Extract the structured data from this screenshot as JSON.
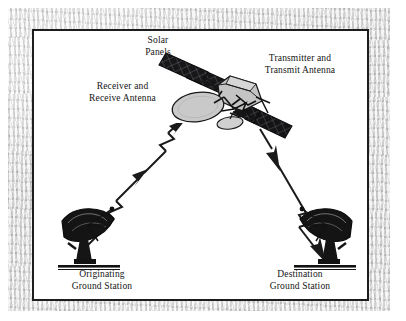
{
  "figure": {
    "type": "satellite-communication-link-diagram",
    "background_color": "#ffffff",
    "frame_color": "#1d1d1d",
    "margin_color": "#d9d9d9",
    "labels": {
      "solar_panels_line1": "Solar",
      "solar_panels_line2": "Panels",
      "transmitter_line1": "Transmitter and",
      "transmitter_line2": "Transmit Antenna",
      "receiver_line1": "Receiver and",
      "receiver_line2": "Receive Antenna",
      "origin_station_line1": "Originating",
      "origin_station_line2": "Ground Station",
      "dest_station_line1": "Destination",
      "dest_station_line2": "Ground Station"
    },
    "elements": {
      "satellite": "satellite-icon",
      "satellite_dish_color": "#c9c9c9",
      "solar_panel_color": "#17171a",
      "uplink_path": "uplink-signal-arrow",
      "downlink_path": "downlink-signal-arrow",
      "signal_color": "#1a1a1a",
      "origin_dish": "ground-station-dish-icon",
      "dest_dish": "ground-station-dish-icon",
      "ground_dish_color": "#171717"
    }
  }
}
